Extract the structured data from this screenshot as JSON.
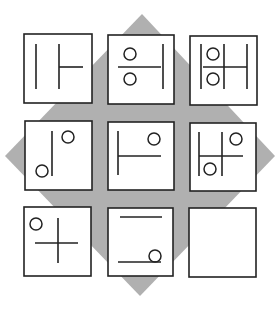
{
  "puzzle": {
    "type": "3x3 visual matrix reasoning puzzle",
    "background_diamond": {
      "color": "#b0b0b0",
      "points": [
        [
          142,
          14
        ],
        [
          275,
          156
        ],
        [
          140,
          296
        ],
        [
          5,
          156
        ]
      ]
    },
    "stroke_color": "#222222",
    "cell_fill": "#ffffff",
    "cells": [
      {
        "id": "r1c1",
        "box": [
          24,
          34,
          68,
          69
        ],
        "lines": [
          [
            36,
            44,
            36,
            89
          ],
          [
            59,
            44,
            59,
            89
          ],
          [
            59,
            67,
            83,
            67
          ]
        ],
        "circles": []
      },
      {
        "id": "r1c2",
        "box": [
          108,
          35,
          66,
          69
        ],
        "lines": [
          [
            118,
            67,
            161,
            67
          ],
          [
            163,
            44,
            163,
            89
          ]
        ],
        "circles": [
          [
            130,
            54,
            6
          ],
          [
            130,
            79,
            6
          ]
        ]
      },
      {
        "id": "r1c3",
        "box": [
          190,
          36,
          67,
          69
        ],
        "lines": [
          [
            201,
            44,
            201,
            89
          ],
          [
            224,
            44,
            224,
            89
          ],
          [
            247,
            44,
            247,
            89
          ],
          [
            203,
            67,
            247,
            67
          ]
        ],
        "circles": [
          [
            213,
            54,
            6
          ],
          [
            213,
            79,
            6
          ]
        ]
      },
      {
        "id": "r2c1",
        "box": [
          25,
          121,
          67,
          69
        ],
        "lines": [
          [
            52,
            131,
            52,
            176
          ]
        ],
        "circles": [
          [
            68,
            137,
            6
          ],
          [
            42,
            171,
            6
          ]
        ]
      },
      {
        "id": "r2c2",
        "box": [
          108,
          122,
          66,
          68
        ],
        "lines": [
          [
            118,
            131,
            118,
            175
          ],
          [
            118,
            156,
            161,
            156
          ]
        ],
        "circles": [
          [
            154,
            139,
            6
          ]
        ]
      },
      {
        "id": "r2c3",
        "box": [
          190,
          123,
          66,
          68
        ],
        "lines": [
          [
            199,
            132,
            199,
            176
          ],
          [
            222,
            132,
            222,
            176
          ],
          [
            199,
            156,
            243,
            156
          ]
        ],
        "circles": [
          [
            236,
            139,
            6
          ],
          [
            210,
            169,
            6
          ]
        ]
      },
      {
        "id": "r3c1",
        "box": [
          24,
          207,
          67,
          69
        ],
        "lines": [
          [
            58,
            218,
            58,
            263
          ],
          [
            35,
            243,
            78,
            243
          ]
        ],
        "circles": [
          [
            36,
            224,
            6
          ]
        ]
      },
      {
        "id": "r3c2",
        "box": [
          108,
          208,
          65,
          68
        ],
        "lines": [
          [
            120,
            217,
            162,
            217
          ],
          [
            118,
            262,
            161,
            262
          ]
        ],
        "circles": [
          [
            155,
            256,
            6
          ]
        ]
      },
      {
        "id": "r3c3",
        "box": [
          189,
          208,
          67,
          69
        ],
        "lines": [],
        "circles": [],
        "empty": true
      }
    ]
  }
}
